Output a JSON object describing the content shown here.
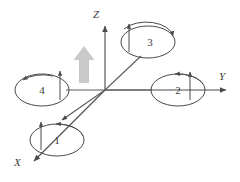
{
  "figure": {
    "kind": "quadrotor-frame-diagram",
    "width": 240,
    "height": 182,
    "background_color": "#ffffff",
    "stroke_color": "#4a4a4a",
    "thrust_arrow_color": "#c9c9c9"
  },
  "axes": {
    "origin": {
      "x": 105,
      "y": 90
    },
    "items": [
      {
        "id": "z",
        "label": "Z",
        "label_x": 93,
        "label_y": 18,
        "tip_x": 105,
        "tip_y": 22,
        "direction": "up"
      },
      {
        "id": "y",
        "label": "Y",
        "label_x": 219,
        "label_y": 80,
        "tip_x": 231,
        "tip_y": 90,
        "direction": "right"
      },
      {
        "id": "x",
        "label": "X",
        "label_x": 14,
        "label_y": 166,
        "tip_x": 30,
        "tip_y": 164,
        "direction": "down-left"
      }
    ]
  },
  "thrust_arrow": {
    "name": "net-thrust-arrow",
    "x": 84,
    "y_tail": 83,
    "y_tip": 47,
    "color": "#c9c9c9"
  },
  "rotors": [
    {
      "id": "rotor-1",
      "label": "1",
      "cx": 57,
      "cy": 140,
      "rx": 27,
      "ry": 16,
      "label_x": 57,
      "label_y": 144,
      "thrust_arrow": {
        "x": 41,
        "y_tail": 150,
        "y_tip": 120
      },
      "spin_arrow_direction": "counter-clockwise",
      "spin_arrow_start_deg": 355,
      "spin_arrow_end_deg": 190
    },
    {
      "id": "rotor-2",
      "label": "2",
      "cx": 178,
      "cy": 90,
      "rx": 27,
      "ry": 16,
      "label_x": 178,
      "label_y": 94,
      "thrust_arrow": {
        "x": 190,
        "y_tail": 100,
        "y_tip": 70
      },
      "spin_arrow_direction": "counter-clockwise",
      "spin_arrow_start_deg": 340,
      "spin_arrow_end_deg": 185
    },
    {
      "id": "rotor-3",
      "label": "3",
      "cx": 148,
      "cy": 42,
      "rx": 27,
      "ry": 16,
      "label_x": 150,
      "label_y": 46,
      "thrust_arrow": {
        "x": 129,
        "y_tail": 52,
        "y_tip": 22
      },
      "spin_arrow_direction": "clockwise",
      "spin_arrow_start_deg": 200,
      "spin_arrow_end_deg": 350
    },
    {
      "id": "rotor-4",
      "label": "4",
      "cx": 42,
      "cy": 90,
      "rx": 27,
      "ry": 16,
      "label_x": 42,
      "label_y": 94,
      "thrust_arrow": {
        "x": 60,
        "y_tail": 100,
        "y_tip": 70
      },
      "spin_arrow_direction": "clockwise",
      "spin_arrow_start_deg": 200,
      "spin_arrow_end_deg": 350
    }
  ],
  "arms": [
    {
      "id": "arm-to-rotor-4",
      "x1": 105,
      "y1": 90,
      "x2": 66,
      "y2": 90
    },
    {
      "id": "arm-to-rotor-2",
      "x1": 105,
      "y1": 90,
      "x2": 152,
      "y2": 90
    },
    {
      "id": "arm-to-rotor-3",
      "x1": 105,
      "y1": 90,
      "x2": 140,
      "y2": 56
    },
    {
      "id": "arm-to-rotor-1",
      "x1": 105,
      "y1": 90,
      "x2": 60,
      "y2": 120
    }
  ]
}
